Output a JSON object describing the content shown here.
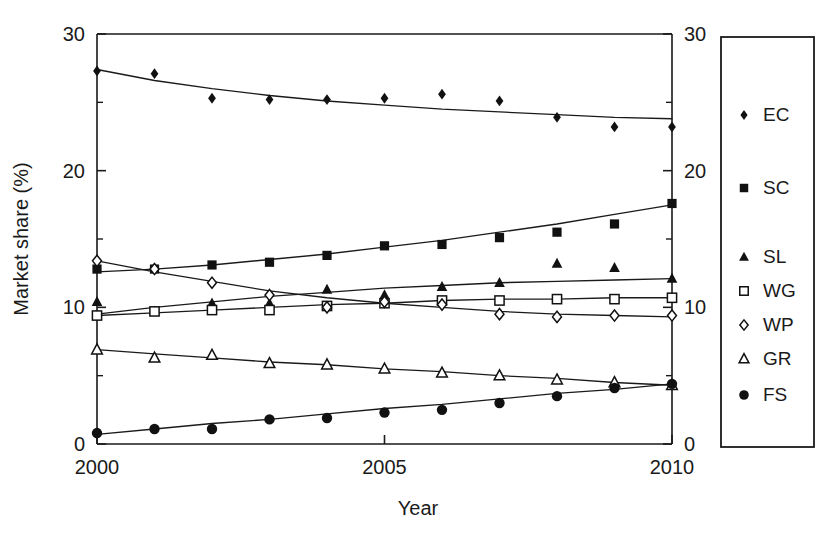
{
  "chart_data": {
    "type": "line",
    "title": "",
    "xlabel": "Year",
    "ylabel": "Market share (%)",
    "xlim": [
      2000,
      2010
    ],
    "ylim": [
      0,
      30
    ],
    "x": [
      2000,
      2001,
      2002,
      2003,
      2004,
      2005,
      2006,
      2007,
      2008,
      2009,
      2010
    ],
    "x_ticks": [
      2000,
      2005,
      2010
    ],
    "x_tick_labels": [
      "2000",
      "2005",
      "2010"
    ],
    "y_ticks": [
      0,
      10,
      20,
      30
    ],
    "y_tick_labels": [
      "0",
      "10",
      "20",
      "30"
    ],
    "y_minor_ticks": [
      5,
      15,
      25
    ],
    "grid": false,
    "legend_position": "right-outside",
    "right_axis_mirrored": true,
    "right_axis_tick_labels": [
      "0",
      "10",
      "20",
      "30"
    ],
    "series": [
      {
        "name": "EC",
        "marker": "filled-diamond",
        "values": [
          27.3,
          27.1,
          25.3,
          25.2,
          25.2,
          25.3,
          25.6,
          25.1,
          23.9,
          23.2,
          23.2
        ],
        "fit": [
          27.4,
          26.6,
          26.0,
          25.5,
          25.1,
          24.8,
          24.5,
          24.3,
          24.1,
          23.9,
          23.8
        ]
      },
      {
        "name": "SC",
        "marker": "filled-square",
        "values": [
          12.8,
          12.8,
          13.1,
          13.3,
          13.8,
          14.5,
          14.6,
          15.1,
          15.5,
          16.1,
          17.6
        ],
        "fit": [
          12.6,
          12.8,
          13.1,
          13.5,
          13.9,
          14.4,
          14.9,
          15.5,
          16.1,
          16.8,
          17.5
        ]
      },
      {
        "name": "SL",
        "marker": "filled-triangle",
        "values": [
          10.4,
          9.7,
          10.3,
          10.3,
          11.3,
          10.9,
          11.5,
          11.8,
          13.2,
          12.9,
          12.1
        ],
        "fit": [
          9.5,
          10.0,
          10.4,
          10.8,
          11.1,
          11.4,
          11.6,
          11.8,
          11.9,
          12.0,
          12.1
        ]
      },
      {
        "name": "WG",
        "marker": "open-square",
        "values": [
          9.4,
          9.7,
          9.8,
          9.8,
          10.1,
          10.3,
          10.5,
          10.5,
          10.6,
          10.6,
          10.7
        ],
        "fit": [
          9.4,
          9.6,
          9.8,
          10.0,
          10.2,
          10.3,
          10.5,
          10.6,
          10.6,
          10.7,
          10.7
        ]
      },
      {
        "name": "WP",
        "marker": "open-diamond",
        "values": [
          13.4,
          12.8,
          11.8,
          10.9,
          10.0,
          10.4,
          10.2,
          9.5,
          9.3,
          9.4,
          9.4
        ],
        "fit": [
          13.4,
          12.6,
          11.9,
          11.2,
          10.7,
          10.3,
          10.0,
          9.7,
          9.5,
          9.4,
          9.3
        ]
      },
      {
        "name": "GR",
        "marker": "open-triangle",
        "values": [
          6.9,
          6.3,
          6.5,
          5.9,
          5.8,
          5.5,
          5.2,
          5.0,
          4.7,
          4.5,
          4.3
        ],
        "fit": [
          6.9,
          6.6,
          6.3,
          6.0,
          5.8,
          5.5,
          5.3,
          5.0,
          4.8,
          4.5,
          4.3
        ]
      },
      {
        "name": "FS",
        "marker": "filled-circle",
        "values": [
          0.8,
          1.1,
          1.1,
          1.8,
          1.9,
          2.3,
          2.5,
          3.0,
          3.5,
          4.1,
          4.4
        ],
        "fit": [
          0.7,
          1.1,
          1.5,
          1.8,
          2.2,
          2.6,
          2.9,
          3.3,
          3.7,
          4.0,
          4.4
        ]
      }
    ]
  },
  "legend": {
    "entries": [
      {
        "label": "EC",
        "marker": "filled-diamond"
      },
      {
        "label": "SC",
        "marker": "filled-square"
      },
      {
        "label": "SL",
        "marker": "filled-triangle"
      },
      {
        "label": "WG",
        "marker": "open-square"
      },
      {
        "label": "WP",
        "marker": "open-diamond"
      },
      {
        "label": "GR",
        "marker": "open-triangle"
      },
      {
        "label": "FS",
        "marker": "filled-circle"
      }
    ]
  },
  "colors": {
    "ink": "#111111",
    "background": "#ffffff"
  }
}
